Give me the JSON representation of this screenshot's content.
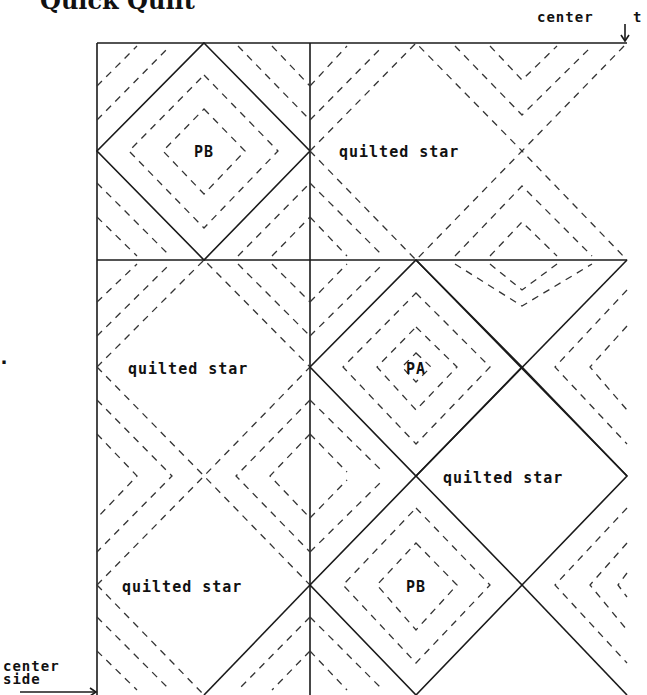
{
  "title": "Quick Quilt",
  "markers": {
    "center_top": "center",
    "center_top_trunc": "t",
    "center_side_line1": "center",
    "center_side_line2": "side",
    "left_dot": "."
  },
  "blocks": {
    "pb_top": "PB",
    "quilted_star_top": "quilted star",
    "quilted_star_mid_left": "quilted star",
    "pa": "PA",
    "quilted_star_mid_right": "quilted star",
    "quilted_star_bottom_left": "quilted star",
    "pb_bottom": "PB"
  },
  "colors": {
    "line": "#1a1a1a",
    "background": "#ffffff"
  }
}
